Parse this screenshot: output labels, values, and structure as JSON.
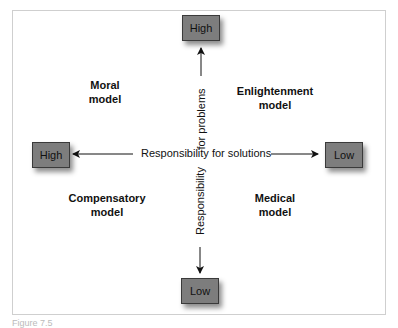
{
  "diagram": {
    "type": "two-axis quadrant diagram",
    "vertical_axis": {
      "label_top": "for problems",
      "label_bottom": "Responsibility",
      "top_end": "High",
      "bottom_end": "Low"
    },
    "horizontal_axis": {
      "label": "Responsibility for solutions",
      "left_end": "High",
      "right_end": "Low"
    },
    "quadrants": {
      "top_left": {
        "line1": "Moral",
        "line2": "model"
      },
      "top_right": {
        "line1": "Enlightenment",
        "line2": "model"
      },
      "bottom_left": {
        "line1": "Compensatory",
        "line2": "model"
      },
      "bottom_right": {
        "line1": "Medical",
        "line2": "model"
      }
    },
    "colors": {
      "box_fill": "#7d7d7d",
      "box_border": "#3a3a3a",
      "frame_border": "#cfcfcf",
      "text": "#111111"
    }
  },
  "caption": "Figure 7.5"
}
